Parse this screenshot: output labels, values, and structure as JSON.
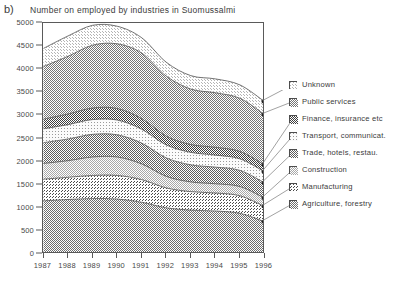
{
  "panel_letter": "b)",
  "legend": {
    "items": [
      {
        "label": "Unknown",
        "swatch": "pattern-unknown"
      },
      {
        "label": "Public services",
        "swatch": "pattern-public-services"
      },
      {
        "label": "Finance, insurance etc",
        "swatch": "pattern-finance"
      },
      {
        "label": "Transport, communicat.",
        "swatch": "pattern-transport"
      },
      {
        "label": "Trade, hotels, restau.",
        "swatch": "pattern-trade"
      },
      {
        "label": "Construction",
        "swatch": "pattern-construction"
      },
      {
        "label": "Manufacturing",
        "swatch": "pattern-manufacturing"
      },
      {
        "label": "Agriculture, forestry",
        "swatch": "pattern-agriculture"
      }
    ]
  },
  "chart_data": {
    "type": "area",
    "stacked": true,
    "title": "Number on employed by industries in Suomussalmi",
    "xlabel": "",
    "ylabel": "",
    "grid": false,
    "legend_position": "right",
    "x": [
      1987,
      1988,
      1989,
      1990,
      1991,
      1992,
      1993,
      1994,
      1995,
      1996
    ],
    "xticklabels": [
      "1987",
      "1988",
      "1989",
      "1990",
      "1991",
      "1992",
      "1993",
      "1994",
      "1995",
      "1996"
    ],
    "yticks": [
      0,
      500,
      1000,
      1500,
      2000,
      2500,
      3000,
      3500,
      4000,
      4500,
      5000
    ],
    "yticklabels": [
      "0",
      "500",
      "1000",
      "1500",
      "2000",
      "2500",
      "3000",
      "3500",
      "4000",
      "4500",
      "5000"
    ],
    "ylim": [
      0,
      5000
    ],
    "xlim": [
      1987,
      1996
    ],
    "series": [
      {
        "name": "Agriculture, forestry",
        "values": [
          1150,
          1180,
          1200,
          1190,
          1120,
          1000,
          950,
          930,
          880,
          700
        ]
      },
      {
        "name": "Manufacturing",
        "values": [
          470,
          480,
          500,
          510,
          490,
          430,
          400,
          390,
          380,
          330
        ]
      },
      {
        "name": "Construction",
        "values": [
          340,
          360,
          400,
          400,
          340,
          250,
          210,
          200,
          200,
          180
        ]
      },
      {
        "name": "Trade, hotels, restau.",
        "values": [
          450,
          470,
          490,
          480,
          450,
          400,
          370,
          360,
          350,
          330
        ]
      },
      {
        "name": "Transport, communicat.",
        "values": [
          300,
          310,
          320,
          320,
          300,
          280,
          270,
          260,
          250,
          240
        ]
      },
      {
        "name": "Finance, insurance etc",
        "values": [
          210,
          230,
          250,
          250,
          230,
          190,
          170,
          170,
          160,
          150
        ]
      },
      {
        "name": "Public services",
        "values": [
          1140,
          1250,
          1360,
          1400,
          1420,
          1300,
          1200,
          1180,
          1150,
          1090
        ]
      },
      {
        "name": "Unknown",
        "values": [
          390,
          440,
          430,
          380,
          330,
          300,
          290,
          300,
          290,
          280
        ]
      }
    ],
    "totals": [
      4450,
      4720,
      4950,
      4930,
      4680,
      4150,
      3860,
      3790,
      3660,
      3300
    ]
  }
}
